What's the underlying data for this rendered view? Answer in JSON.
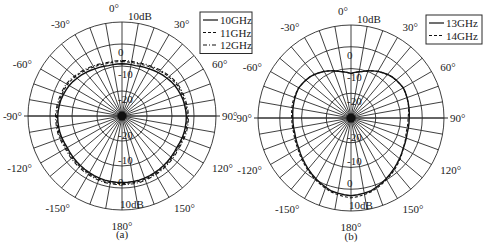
{
  "chart_data": [
    {
      "type": "polar",
      "caption": "(a)",
      "title": "",
      "radial_unit": "dB",
      "radial_tick_labels": [
        "10dB",
        "0",
        "-10",
        "-20"
      ],
      "radial_ticks": [
        10,
        0,
        -10,
        -20
      ],
      "angle_tick_labels": [
        "0°",
        "30°",
        "60°",
        "90°",
        "120°",
        "150°",
        "180°",
        "-150°",
        "-120°",
        "-90°",
        "-60°",
        "-30°"
      ],
      "angle_step_grid": 10,
      "legend": [
        "10GHz",
        "11GHz",
        "12GHz"
      ],
      "angles": [
        0,
        15,
        30,
        45,
        60,
        75,
        90,
        105,
        120,
        135,
        150,
        165,
        180,
        195,
        210,
        225,
        240,
        255,
        270,
        285,
        300,
        315,
        330,
        345
      ],
      "series": [
        {
          "name": "10GHz",
          "style": "solid",
          "values": [
            -9,
            -9,
            -8,
            -6.5,
            -5,
            -4,
            -3.5,
            -3.5,
            -4,
            -3.5,
            -3,
            -2.5,
            -2.5,
            -2.5,
            -3,
            -3.5,
            -4,
            -3.5,
            -3.5,
            -4,
            -5,
            -6.5,
            -8,
            -9
          ]
        },
        {
          "name": "11GHz",
          "style": "dashed",
          "values": [
            -8,
            -8,
            -7,
            -5.5,
            -4,
            -3.5,
            -3,
            -3,
            -3.5,
            -3,
            -2.5,
            -2,
            -2,
            -2,
            -2.5,
            -3,
            -3.5,
            -3,
            -3,
            -3.5,
            -4,
            -5.5,
            -7,
            -8
          ]
        },
        {
          "name": "12GHz",
          "style": "dashdot",
          "values": [
            -7.5,
            -7.5,
            -6.5,
            -5,
            -3.5,
            -3,
            -2.5,
            -2.5,
            -3,
            -2.5,
            -2,
            -1.5,
            -1.5,
            -1.5,
            -2,
            -2.5,
            -3,
            -2.5,
            -2.5,
            -3,
            -3.5,
            -5,
            -6.5,
            -7.5
          ]
        }
      ]
    },
    {
      "type": "polar",
      "caption": "(b)",
      "title": "",
      "radial_unit": "dB",
      "radial_tick_labels": [
        "10dB",
        "0",
        "-10",
        "-20"
      ],
      "radial_ticks": [
        10,
        0,
        -10,
        -20
      ],
      "angle_tick_labels": [
        "0°",
        "30°",
        "60°",
        "90°",
        "120°",
        "150°",
        "180°",
        "-150°",
        "-120°",
        "-90°",
        "-60°",
        "-30°"
      ],
      "angle_step_grid": 10,
      "legend": [
        "13GHz",
        "14GHz"
      ],
      "angles": [
        0,
        15,
        30,
        45,
        60,
        75,
        90,
        105,
        120,
        135,
        150,
        165,
        180,
        195,
        210,
        225,
        240,
        255,
        270,
        285,
        300,
        315,
        330,
        345
      ],
      "series": [
        {
          "name": "13GHz",
          "style": "solid",
          "values": [
            -12,
            -10.5,
            -8,
            -6,
            -5,
            -5.5,
            -6,
            -6,
            -5,
            -3,
            -0.5,
            2,
            3,
            2,
            -0.5,
            -3,
            -5,
            -6,
            -6,
            -5.5,
            -5,
            -6,
            -8,
            -10.5
          ]
        },
        {
          "name": "14GHz",
          "style": "dashed",
          "values": [
            -12,
            -10.5,
            -8,
            -6,
            -5,
            -5.5,
            -6.5,
            -6.5,
            -5,
            -2.5,
            0,
            2.5,
            4,
            2.5,
            0,
            -2.5,
            -4.5,
            -5.5,
            -5.5,
            -5,
            -5,
            -6,
            -8,
            -10.5
          ]
        }
      ]
    }
  ],
  "figure": {
    "panels": [
      {
        "id": "a",
        "caption": "(a)",
        "legend_labels": [
          "10GHz",
          "11GHz",
          "12GHz"
        ]
      },
      {
        "id": "b",
        "caption": "(b)",
        "legend_labels": [
          "13GHz",
          "14GHz"
        ]
      }
    ],
    "top_label": "0°",
    "outer_ring_label": "10dB",
    "bottom_label": "180°"
  },
  "colors": {
    "ink": "#1a1a1a",
    "background": "#ffffff"
  }
}
